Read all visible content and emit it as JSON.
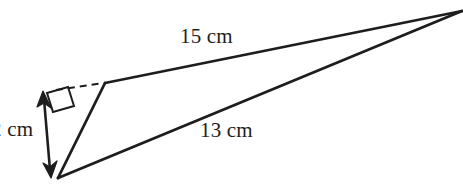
{
  "figure": {
    "type": "geometry-diagram",
    "shape": "triangle",
    "background_color": "#ffffff",
    "stroke_color": "#1d1d1d",
    "labels": {
      "side_upper": "15 cm",
      "side_lower": "13 cm",
      "height": "2 cm"
    },
    "vertices": {
      "apex": {
        "x": 462,
        "y": 11
      },
      "upper_left": {
        "x": 105,
        "y": 83
      },
      "bottom": {
        "x": 58,
        "y": 178
      }
    },
    "height_arrow": {
      "from": {
        "x": 44,
        "y": 95
      },
      "to": {
        "x": 50,
        "y": 174
      },
      "double_headed": true
    },
    "dashed_extension": {
      "from": {
        "x": 56,
        "y": 90
      },
      "to": {
        "x": 105,
        "y": 83
      }
    },
    "right_angle_marker": {
      "x": 48,
      "y": 86,
      "size": 22
    }
  }
}
